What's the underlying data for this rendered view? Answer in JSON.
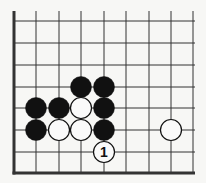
{
  "diagram": {
    "type": "go-board-fragment",
    "background": "#f7f7f5",
    "line_color": "#333333",
    "grid": {
      "columns_x": [
        14,
        36,
        59,
        81,
        104,
        126,
        149,
        171,
        193
      ],
      "rows_y": [
        21,
        43,
        65,
        87,
        108,
        130,
        152,
        173
      ],
      "top_extent_y": 11,
      "right_extent_x": 195,
      "edges": [
        "left",
        "bottom"
      ]
    },
    "stone_radius": 10.5,
    "stones": [
      {
        "color": "black",
        "col": 3,
        "row": 3
      },
      {
        "color": "black",
        "col": 4,
        "row": 3
      },
      {
        "color": "black",
        "col": 1,
        "row": 4
      },
      {
        "color": "black",
        "col": 2,
        "row": 4
      },
      {
        "color": "white",
        "col": 3,
        "row": 4
      },
      {
        "color": "black",
        "col": 4,
        "row": 4
      },
      {
        "color": "black",
        "col": 1,
        "row": 5
      },
      {
        "color": "white",
        "col": 2,
        "row": 5
      },
      {
        "color": "white",
        "col": 3,
        "row": 5
      },
      {
        "color": "black",
        "col": 4,
        "row": 5
      },
      {
        "color": "white",
        "col": 7,
        "row": 5
      },
      {
        "color": "white",
        "col": 4,
        "row": 6,
        "label": "1"
      }
    ]
  }
}
